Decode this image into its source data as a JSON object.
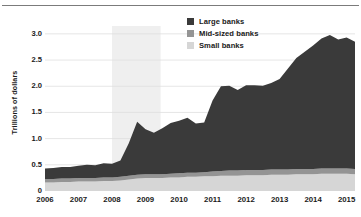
{
  "chart_data": {
    "type": "area",
    "title": "",
    "subtitle": "",
    "xlabel": "",
    "ylabel": "Trillions of dollars",
    "stacked": true,
    "grid": true,
    "legend_position": "top-center-right",
    "xlim": [
      2006,
      2015.25
    ],
    "ylim": [
      0,
      3.15
    ],
    "xticks": [
      "2006",
      "2007",
      "2008",
      "2009",
      "2010",
      "2011",
      "2012",
      "2013",
      "2014",
      "2015"
    ],
    "xtick_values": [
      2006,
      2007,
      2008,
      2009,
      2010,
      2011,
      2012,
      2013,
      2014,
      2015
    ],
    "yticks": [
      "0",
      "0.5",
      "1.0",
      "1.5",
      "2.0",
      "2.5",
      "3.0"
    ],
    "ytick_values": [
      0,
      0.5,
      1.0,
      1.5,
      2.0,
      2.5,
      3.0
    ],
    "colors": {
      "large_banks": "#3a3a3a",
      "mid_sized_banks": "#949494",
      "small_banks": "#d6d6d6",
      "recession_band": "#efefef",
      "gridline": "#dedede",
      "axis": "#8a8a8a",
      "text": "#1a1a1a",
      "background": "#ffffff"
    },
    "recession_band": {
      "start": 2008.0,
      "end": 2009.45,
      "label": ""
    },
    "x": [
      2006.0,
      2006.25,
      2006.5,
      2006.75,
      2007.0,
      2007.25,
      2007.5,
      2007.75,
      2008.0,
      2008.25,
      2008.5,
      2008.75,
      2009.0,
      2009.25,
      2009.5,
      2009.75,
      2010.0,
      2010.25,
      2010.5,
      2010.75,
      2011.0,
      2011.25,
      2011.5,
      2011.75,
      2012.0,
      2012.25,
      2012.5,
      2012.75,
      2013.0,
      2013.25,
      2013.5,
      2013.75,
      2014.0,
      2014.25,
      2014.5,
      2014.75,
      2015.0,
      2015.25
    ],
    "series": [
      {
        "name": "Small banks",
        "values": [
          0.16,
          0.16,
          0.17,
          0.17,
          0.18,
          0.18,
          0.18,
          0.19,
          0.19,
          0.2,
          0.22,
          0.24,
          0.25,
          0.25,
          0.25,
          0.26,
          0.26,
          0.27,
          0.27,
          0.28,
          0.28,
          0.29,
          0.29,
          0.29,
          0.3,
          0.3,
          0.3,
          0.31,
          0.31,
          0.31,
          0.32,
          0.32,
          0.32,
          0.33,
          0.33,
          0.33,
          0.33,
          0.32
        ]
      },
      {
        "name": "Mid-sized banks",
        "values": [
          0.07,
          0.07,
          0.07,
          0.07,
          0.07,
          0.07,
          0.07,
          0.07,
          0.07,
          0.07,
          0.07,
          0.07,
          0.07,
          0.07,
          0.07,
          0.07,
          0.08,
          0.08,
          0.08,
          0.08,
          0.09,
          0.09,
          0.1,
          0.1,
          0.1,
          0.1,
          0.1,
          0.1,
          0.1,
          0.1,
          0.1,
          0.1,
          0.1,
          0.1,
          0.1,
          0.1,
          0.1,
          0.1
        ]
      },
      {
        "name": "Large banks",
        "values": [
          0.2,
          0.21,
          0.22,
          0.22,
          0.23,
          0.25,
          0.24,
          0.27,
          0.26,
          0.31,
          0.62,
          1.01,
          0.86,
          0.79,
          0.88,
          0.97,
          1.0,
          1.05,
          0.94,
          0.95,
          1.36,
          1.62,
          1.62,
          1.54,
          1.62,
          1.62,
          1.61,
          1.65,
          1.73,
          1.93,
          2.12,
          2.24,
          2.36,
          2.48,
          2.55,
          2.46,
          2.5,
          2.43
        ]
      }
    ]
  },
  "legend": {
    "items": [
      {
        "label": "Large banks",
        "color": "#3a3a3a"
      },
      {
        "label": "Mid-sized banks",
        "color": "#949494"
      },
      {
        "label": "Small banks",
        "color": "#d6d6d6"
      }
    ]
  },
  "axis": {
    "y_title": "Trillions of dollars"
  }
}
